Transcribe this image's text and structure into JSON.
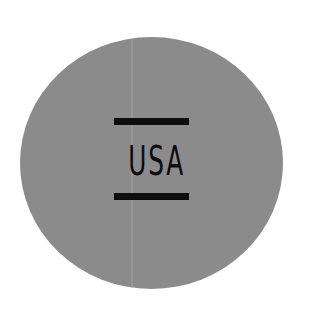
{
  "badge": {
    "text": "USA",
    "shape": "circle",
    "fill_color": "#8b8b8b",
    "ink_color": "#0d0d0d",
    "decorations": [
      "top-bar",
      "bottom-bar"
    ]
  }
}
